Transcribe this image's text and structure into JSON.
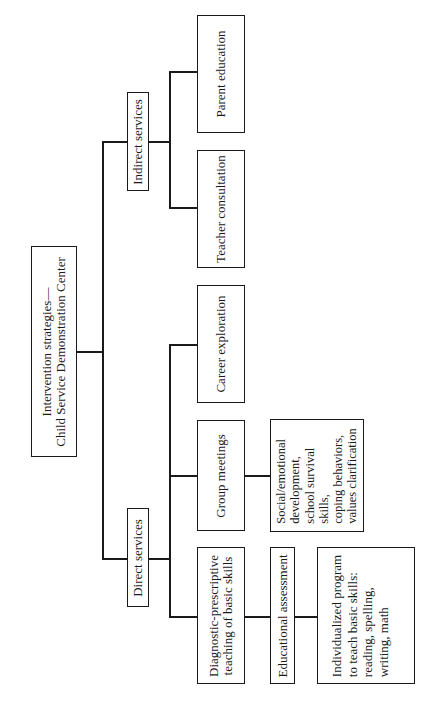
{
  "diagram": {
    "type": "tree",
    "orientation": "rotated -90deg (reads bottom-to-top)",
    "root": {
      "lines": [
        "Intervention strategies—",
        "Child Service Demonstration Center"
      ]
    },
    "branches": {
      "direct": {
        "label": "Direct services",
        "children": {
          "diagnostic": {
            "lines": [
              "Diagnostic-prescriptive",
              "teaching of basic skills"
            ],
            "assessment": {
              "label": "Educational assessment"
            },
            "program": {
              "lines": [
                "Individualized program",
                "to teach basic skills:",
                "reading, spelling,",
                "writing, math"
              ]
            }
          },
          "group": {
            "label": "Group meetings",
            "detail": {
              "lines": [
                "Social/emotional",
                "development,",
                "school survival",
                "skills,",
                "coping behaviors,",
                "values clarification"
              ]
            }
          },
          "career": {
            "label": "Career exploration"
          }
        }
      },
      "indirect": {
        "label": "Indirect services",
        "children": {
          "teacher": {
            "label": "Teacher consultation"
          },
          "parent": {
            "label": "Parent education"
          }
        }
      }
    }
  }
}
